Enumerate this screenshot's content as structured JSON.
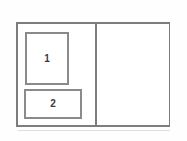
{
  "diagram": {
    "colors": {
      "page_background": "#ffffff",
      "frame_border": "#7d7d7d",
      "box_border": "#8a8a8a",
      "box_fill": "#ffffff",
      "label_text": "#3a3a3a",
      "baseline_shadow": "#dedede"
    },
    "outer_frame": {
      "name": "outer container"
    },
    "left_pane": {
      "name": "left pane",
      "boxes": [
        {
          "label": "1",
          "shape": "portrait rectangle",
          "position": "top"
        },
        {
          "label": "2",
          "shape": "landscape rectangle",
          "position": "bottom"
        }
      ]
    },
    "right_pane": {
      "name": "right pane",
      "content": ""
    },
    "divider": {
      "name": "vertical divider",
      "orientation": "vertical"
    }
  }
}
